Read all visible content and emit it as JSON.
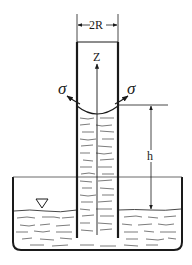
{
  "diagram": {
    "labels": {
      "diameter": "2R",
      "axis": "Z",
      "tension_left": "σ",
      "tension_right": "σ",
      "height": "h"
    },
    "symbols": {
      "free_surface_marker": "water-surface-triangle"
    },
    "colors": {
      "line": "#1a1a1a",
      "background": "#ffffff"
    }
  }
}
